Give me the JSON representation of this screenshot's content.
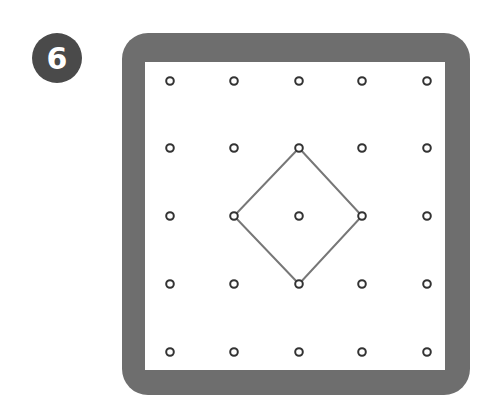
{
  "problem": {
    "number": "6",
    "badge_color": "#4a4a4a"
  },
  "board": {
    "frame_color": "#6e6e6e",
    "inner_color": "#ffffff",
    "peg_color": "#333333",
    "shape_color": "#777777",
    "grid_size": 5,
    "pegs_x": [
      170,
      234,
      299,
      362,
      427
    ],
    "pegs_y": [
      81,
      148,
      216,
      284,
      352
    ],
    "shape": {
      "type": "square (rotated 45°)",
      "vertices_grid": [
        [
          2,
          1
        ],
        [
          3,
          2
        ],
        [
          2,
          3
        ],
        [
          1,
          2
        ]
      ]
    }
  }
}
